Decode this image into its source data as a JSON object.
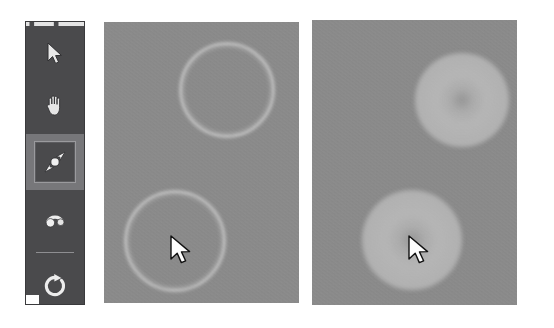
{
  "app": {
    "background_color": "#ffffff",
    "canvas_color": "#8c8c8c",
    "toolbar_color": "#4a4a4c",
    "selection_highlight_color": "#77777a"
  },
  "toolbar": {
    "name": "tool-palette",
    "selected_tool_id": "scale-tool",
    "tools": [
      {
        "id": "select-tool",
        "icon": "arrow-cursor-icon",
        "label": "Select",
        "selected": false
      },
      {
        "id": "pan-tool",
        "icon": "hand-icon",
        "label": "Pan",
        "selected": false
      },
      {
        "id": "scale-tool",
        "icon": "scale-arrows-icon",
        "label": "Scale",
        "selected": true
      },
      {
        "id": "rotate-tool",
        "icon": "rotate-arc-icon",
        "label": "Rotate",
        "selected": false
      },
      {
        "id": "reset-tool",
        "icon": "circular-refresh-icon",
        "label": "Reset",
        "selected": false
      }
    ]
  },
  "panels": [
    {
      "id": "panel-before",
      "label": "Before",
      "render_style": "outline-rings",
      "shapes": [
        {
          "id": "ring-upper",
          "type": "ring",
          "cx": 121,
          "cy": 66,
          "r": 45
        },
        {
          "id": "ring-lower",
          "type": "ring",
          "cx": 69,
          "cy": 217,
          "r": 48
        }
      ],
      "cursor": {
        "id": "cursor-before",
        "x": 68,
        "y": 216,
        "icon": "arrow-cursor-icon"
      }
    },
    {
      "id": "panel-after",
      "label": "After",
      "render_style": "filled-discs",
      "shapes": [
        {
          "id": "disc-upper",
          "type": "disc",
          "cx": 150,
          "cy": 80,
          "r": 47
        },
        {
          "id": "disc-lower",
          "type": "disc",
          "cx": 100,
          "cy": 220,
          "r": 50
        }
      ],
      "cursor": {
        "id": "cursor-after",
        "x": 98,
        "y": 218,
        "icon": "arrow-cursor-icon"
      }
    }
  ]
}
